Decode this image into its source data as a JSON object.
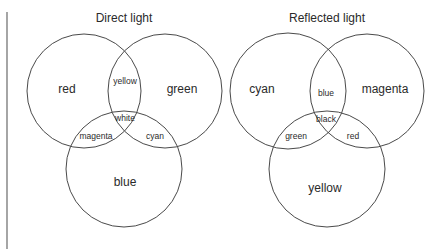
{
  "diagrams": [
    {
      "title": "Direct light",
      "circles": {
        "a": "red",
        "b": "green",
        "c": "blue"
      },
      "overlaps": {
        "ab": "yellow",
        "ac": "magenta",
        "bc": "cyan",
        "abc": "white"
      }
    },
    {
      "title": "Reflected light",
      "circles": {
        "a": "cyan",
        "b": "magenta",
        "c": "yellow"
      },
      "overlaps": {
        "ab": "blue",
        "ac": "green",
        "bc": "red",
        "abc": "black"
      }
    }
  ]
}
